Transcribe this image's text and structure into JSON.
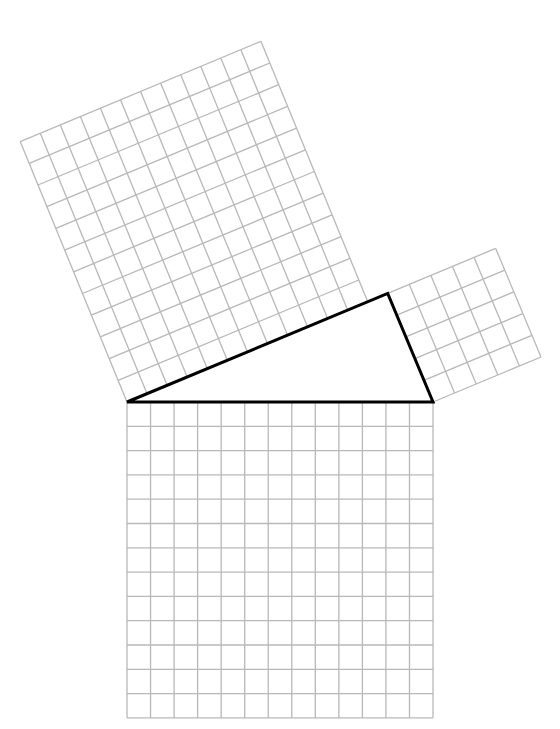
{
  "figure": {
    "title": "Pythagorean theorem grid squares on a 5-12-13 right triangle",
    "background": "#ffffff",
    "grid_color": "#b8b8b8",
    "triangle_color": "#000000",
    "unit_px": 23.54,
    "triangle": {
      "vertices": {
        "A": [
          127,
          402
        ],
        "B": [
          433,
          402
        ],
        "C": [
          387.7,
          293.4
        ]
      },
      "sides": {
        "hypotenuse_AB": 13,
        "leg_AC": 12,
        "leg_BC": 5
      }
    },
    "squares": [
      {
        "name": "square-on-hypotenuse",
        "cells": 13,
        "origin": [
          127,
          402
        ],
        "u": [
          23.54,
          0
        ],
        "v": [
          0,
          24.3
        ]
      },
      {
        "name": "square-on-long-leg",
        "cells": 12,
        "origin": [
          127,
          402
        ],
        "u": [
          20.06,
          -8.36
        ],
        "v": [
          -8.9,
          -21.7
        ]
      },
      {
        "name": "square-on-short-leg",
        "cells": 5,
        "origin": [
          433,
          402
        ],
        "u": [
          -9.06,
          -21.72
        ],
        "v": [
          21.6,
          -9.0
        ]
      }
    ]
  }
}
